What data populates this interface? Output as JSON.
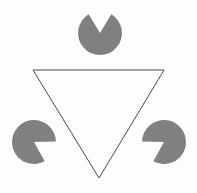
{
  "figure": {
    "name": "Kanizsa triangle illusion",
    "width": 197,
    "height": 193,
    "background_color": "#fdfdfd",
    "disc_color": "#808080",
    "outline_color": "#4a4a4a",
    "outline_width": 1,
    "discs": [
      {
        "id": "top-disc",
        "label": "top pacman disc",
        "cx": 100,
        "cy": 33,
        "r": 22,
        "notch_direction_degrees": 90,
        "notch_angle_degrees": 62
      },
      {
        "id": "bottom-left-disc",
        "label": "bottom left pacman disc",
        "cx": 34,
        "cy": 142,
        "r": 22,
        "notch_direction_degrees": 330,
        "notch_angle_degrees": 62
      },
      {
        "id": "bottom-right-disc",
        "label": "bottom right pacman disc",
        "cx": 164,
        "cy": 142,
        "r": 22,
        "notch_direction_degrees": 210,
        "notch_angle_degrees": 62
      }
    ],
    "outlined_triangle": {
      "id": "inverted-outline-triangle",
      "label": "inverted outlined triangle",
      "points": "33,70 164,70 99,178"
    },
    "illusory_triangle": {
      "id": "illusory-triangle",
      "label": "illusory upright triangle",
      "points": "100,33 34,142 164,142",
      "visible": false
    }
  }
}
